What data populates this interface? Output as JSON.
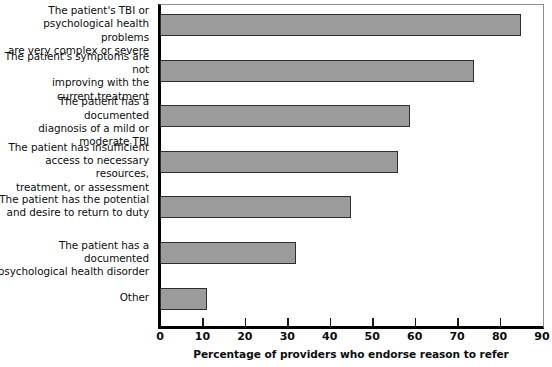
{
  "chart_data": {
    "type": "bar",
    "orientation": "horizontal",
    "title": "",
    "xlabel": "Percentage of providers who endorse reason to refer",
    "ylabel": "",
    "xlim": [
      0,
      90
    ],
    "xticks": [
      0,
      10,
      20,
      30,
      40,
      50,
      60,
      70,
      80,
      90
    ],
    "grid": false,
    "legend": false,
    "bar_color": "#9b9b9b",
    "bar_edge_color": "#2f2f2f",
    "axis_color": "#000000",
    "categories": [
      "The patient's TBI or psychological health problems are very complex or severe",
      "The patient's symptoms are not improving with the current treatment",
      "The patient has a documented diagnosis of a mild or moderate TBI",
      "The patient has insufficient access to necessary resources, treatment, or assessment",
      "The patient has the potential and desire to return to duty",
      "The patient has a documented psychological health disorder",
      "Other"
    ],
    "values": [
      85,
      74,
      59,
      56,
      45,
      32,
      11
    ]
  },
  "categories_wrapped": [
    [
      "The patient's TBI or",
      "psychological health problems",
      "are very complex or severe"
    ],
    [
      "The patient's symptoms are not",
      "improving with the",
      "current treatment"
    ],
    [
      "The patient has a documented",
      "diagnosis of a mild or",
      "moderate TBI"
    ],
    [
      "The patient has insufficient",
      "access to necessary resources,",
      "treatment, or assessment"
    ],
    [
      "The patient has the potential",
      "and desire to return to duty"
    ],
    [
      "The patient has a documented",
      "psychological health disorder"
    ],
    [
      "Other"
    ]
  ],
  "xticks_labels": [
    "0",
    "10",
    "20",
    "30",
    "40",
    "50",
    "60",
    "70",
    "80",
    "90"
  ],
  "axis_title": "Percentage of providers who endorse reason to refer"
}
